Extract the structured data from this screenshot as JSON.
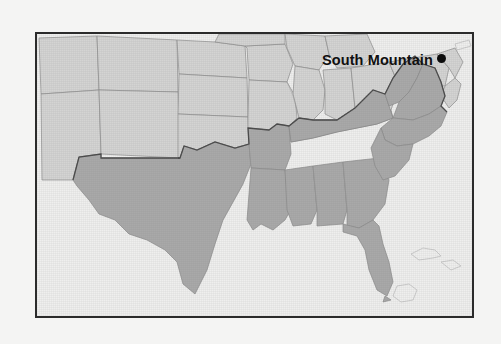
{
  "figure": {
    "type": "map",
    "region": "United States",
    "frame_border_color": "#2b2b2b",
    "background_color": "#f4f4f3",
    "water_color": "#efefee"
  },
  "map": {
    "shaded_fill_color": "#a9a9a9",
    "unshaded_fill_color": "#d4d4d3",
    "border_line_color": "#8d8d8d",
    "region_outline_color": "#4a4a4a",
    "shaded_region_name": "The South",
    "shaded_states": [
      "Texas",
      "Arkansas",
      "Louisiana",
      "Mississippi",
      "Alabama",
      "Georgia",
      "Florida",
      "Tennessee",
      "Kentucky",
      "West Virginia",
      "Virginia",
      "North Carolina",
      "South Carolina"
    ],
    "unshaded_states": [
      "Utah",
      "Colorado",
      "Arizona",
      "New Mexico",
      "Nebraska",
      "Kansas",
      "Oklahoma",
      "Iowa",
      "Missouri",
      "Wisconsin",
      "Illinois",
      "Indiana",
      "Ohio",
      "Michigan",
      "Pennsylvania",
      "Maryland",
      "New Jersey",
      "Delaware"
    ]
  },
  "annotations": {
    "markers": [
      {
        "label": "South Mountain",
        "label_x": 285,
        "label_y": 19,
        "dot_x": 404,
        "dot_y": 24,
        "dot_color": "#0c0c0c"
      }
    ]
  }
}
